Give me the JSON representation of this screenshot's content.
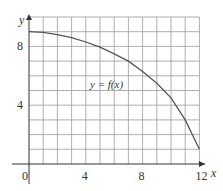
{
  "chart_data": {
    "type": "line",
    "title": "",
    "xlabel": "x",
    "ylabel": "y",
    "curve_label": "y = f(x)",
    "xlim": [
      0,
      12
    ],
    "ylim": [
      0,
      10
    ],
    "grid": true,
    "x_ticks": [
      {
        "value": 0,
        "label": "0"
      },
      {
        "value": 4,
        "label": "4"
      },
      {
        "value": 8,
        "label": "8"
      },
      {
        "value": 12,
        "label": "12"
      }
    ],
    "y_ticks": [
      {
        "value": 4,
        "label": "4"
      },
      {
        "value": 8,
        "label": "8"
      }
    ],
    "series": [
      {
        "name": "y = f(x)",
        "x": [
          0,
          1,
          2,
          3,
          4,
          5,
          6,
          7,
          8,
          9,
          10,
          11,
          12
        ],
        "y": [
          9.0,
          8.95,
          8.8,
          8.6,
          8.3,
          7.95,
          7.5,
          7.0,
          6.3,
          5.5,
          4.5,
          3.0,
          1.0
        ]
      }
    ],
    "colors": {
      "grid": "#9a9a9a",
      "curve": "#555555",
      "axis": "#333333"
    }
  }
}
